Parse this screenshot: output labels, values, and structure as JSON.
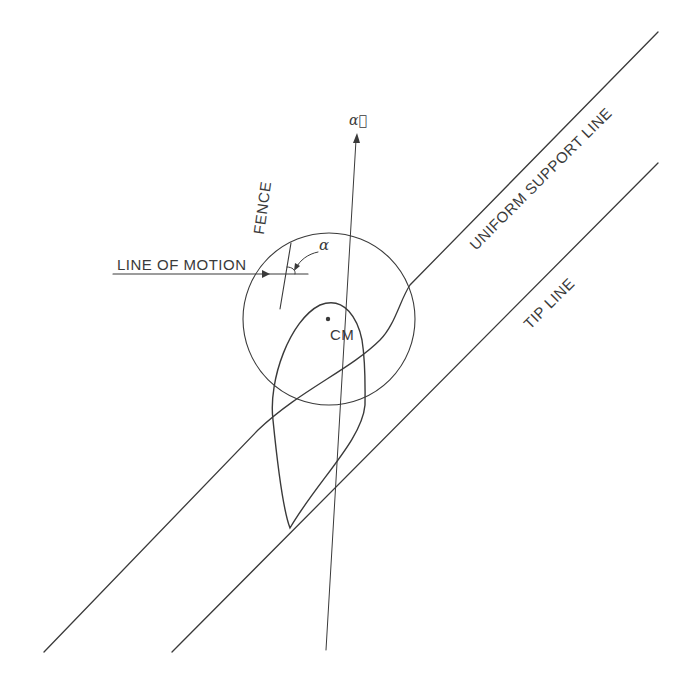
{
  "diagram": {
    "labels": {
      "line_of_motion": "LINE OF MOTION",
      "fence": "FENCE",
      "alpha": "α",
      "alpha_vector": "α⃗",
      "cm": "CM",
      "uniform_support_line": "UNIFORM SUPPORT LINE",
      "tip_line": "TIP LINE"
    },
    "colors": {
      "stroke": "#3a3a3a",
      "background": "#ffffff"
    }
  }
}
